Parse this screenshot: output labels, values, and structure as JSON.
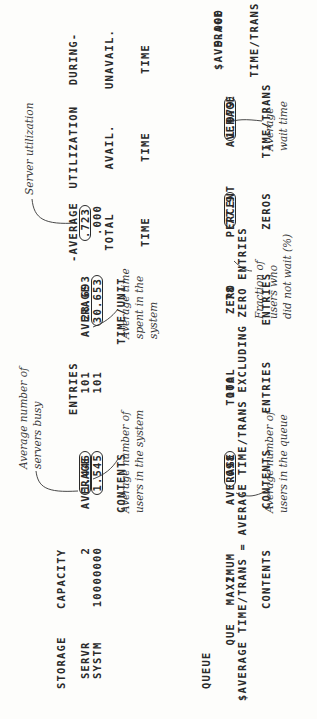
{
  "storage_table": {
    "header": {
      "storage": "STORAGE",
      "capacity": "CAPACITY",
      "avg_contents_1": "AVERAGE",
      "avg_contents_2": "CONTENTS",
      "entries": "ENTRIES",
      "avg_time_unit_1": "AVERAGE",
      "avg_time_unit_2": "TIME/UNIT",
      "avg_total_time_1": "-AVERAGE",
      "avg_total_time_2": "TOTAL",
      "avg_total_time_3": "TIME",
      "util_avail_1": "UTILIZATION",
      "util_avail_2": "AVAIL.",
      "util_avail_3": "TIME",
      "util_unavail_1": "DURING-",
      "util_unavail_2": "UNAVAIL.",
      "util_unavail_3": "TIME"
    },
    "rows": [
      {
        "name": "SERVR",
        "capacity": "2",
        "avg_contents": "1.446",
        "entries": "101",
        "avg_time_unit": "28.693",
        "avg_total_time": ".723"
      },
      {
        "name": "SYSTM",
        "capacity": "10000000",
        "avg_contents": "1.545",
        "entries": "101",
        "avg_time_unit": "30.653",
        "avg_total_time": ".000"
      }
    ]
  },
  "queue_table": {
    "header": {
      "queue": "QUEUE",
      "max_contents_1": "MAXIMUM",
      "max_contents_2": "CONTENTS",
      "avg_contents_1": "AVERAGE",
      "avg_contents_2": "CONTENTS",
      "total_entries_1": "TOTAL",
      "total_entries_2": "ENTRIES",
      "zero_entries_1": "ZERO",
      "zero_entries_2": "ENTRIES",
      "percent_zeros_1": "PERCENT",
      "percent_zeros_2": "ZEROS",
      "avg_time_trans_1": "AVERAGE",
      "avg_time_trans_2": "TIME/TRANS",
      "s_avg_time_trans_1": "$AVERAGE",
      "s_avg_time_trans_2": "TIME/TRANS"
    },
    "rows": [
      {
        "name": "QUE",
        "max_contents": "2",
        "avg_contents": ".098",
        "total_entries": "100",
        "zero_entries": "78",
        "percent_zeros": "77.9",
        "avg_time_trans": "1.979",
        "s_avg_time_trans": "9.000"
      }
    ],
    "footnote": "$AVERAGE TIME/TRANS = AVERAGE TIME/TRANS EXCLUDING ZERO ENTRIES"
  },
  "annotations": {
    "servers_busy": "Average number of\nservers busy",
    "users_in_system": "Average number of\nusers in the system",
    "time_in_system": "Average time\nspent in the\nsystem",
    "server_utilization": "Server utilization",
    "users_in_queue": "Average number of\nusers in the queue",
    "did_not_wait": "Fraction of\nusers who\ndid not wait (%)",
    "wait_time": "Average\nwait time"
  }
}
